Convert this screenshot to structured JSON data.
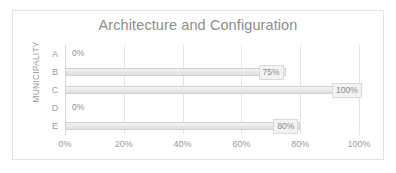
{
  "chart_data": {
    "type": "bar",
    "orientation": "horizontal",
    "title": "Architecture and Configuration",
    "xlabel": "",
    "ylabel": "MUNICIPALITY",
    "categories": [
      "A",
      "B",
      "C",
      "D",
      "E"
    ],
    "values": [
      0,
      75,
      100,
      0,
      80
    ],
    "data_labels": [
      "0%",
      "75%",
      "100%",
      "0%",
      "80%"
    ],
    "xlim": [
      0,
      100
    ],
    "xticks": [
      0,
      20,
      40,
      60,
      80,
      100
    ],
    "xtick_labels": [
      "0%",
      "20%",
      "40%",
      "60%",
      "80%",
      "100%"
    ],
    "grid": true,
    "grid_axis": "x",
    "legend": false,
    "series": [
      {
        "name": "Architecture and Configuration",
        "values": [
          0,
          75,
          100,
          0,
          80
        ]
      }
    ]
  },
  "colors": {
    "bar_fill": "#e9e9e9",
    "bar_stroke": "#d0d0d0",
    "gridline": "#e4e4e4",
    "text": "#9a9a9a",
    "title_text": "#8d8d8d",
    "frame_border": "#e2e2e2",
    "background": "#ffffff"
  }
}
